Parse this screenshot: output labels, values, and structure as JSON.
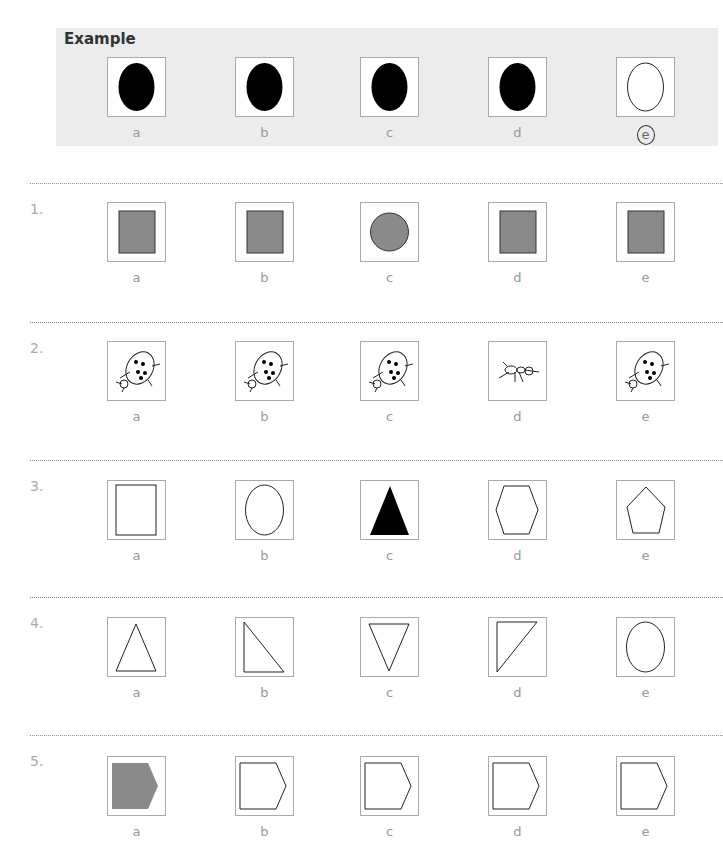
{
  "example": {
    "title": "Example",
    "options": [
      "a",
      "b",
      "c",
      "d",
      "e"
    ],
    "shapes": [
      "black-oval",
      "black-oval",
      "black-oval",
      "black-oval",
      "white-oval"
    ],
    "answer": "e"
  },
  "questions": [
    {
      "number": "1.",
      "options": [
        "a",
        "b",
        "c",
        "d",
        "e"
      ],
      "shapes": [
        "grey-square",
        "grey-square",
        "grey-circle",
        "grey-square",
        "grey-square"
      ]
    },
    {
      "number": "2.",
      "options": [
        "a",
        "b",
        "c",
        "d",
        "e"
      ],
      "shapes": [
        "ladybird",
        "ladybird",
        "ladybird",
        "ant",
        "ladybird"
      ]
    },
    {
      "number": "3.",
      "options": [
        "a",
        "b",
        "c",
        "d",
        "e"
      ],
      "shapes": [
        "rectangle-outline",
        "oval-outline",
        "black-triangle",
        "hexagon-outline",
        "pentagon-outline"
      ]
    },
    {
      "number": "4.",
      "options": [
        "a",
        "b",
        "c",
        "d",
        "e"
      ],
      "shapes": [
        "triangle-up",
        "right-triangle",
        "triangle-down",
        "right-triangle-flipped",
        "oval-outline"
      ]
    },
    {
      "number": "5.",
      "options": [
        "a",
        "b",
        "c",
        "d",
        "e"
      ],
      "shapes": [
        "grey-arrow-pentagon",
        "arrow-pentagon-outline",
        "arrow-pentagon-outline",
        "arrow-pentagon-outline",
        "arrow-pentagon-outline"
      ]
    }
  ]
}
